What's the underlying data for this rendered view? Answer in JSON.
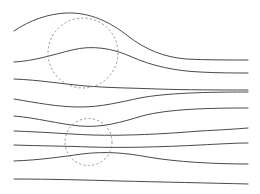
{
  "figure": {
    "kind": "streamline-flow-diagram",
    "title": "",
    "background_color": "#ffffff",
    "width": 260,
    "height": 194
  },
  "style": {
    "streamline_color": "#4a4a4a",
    "streamline_width": 1,
    "circle_color": "#8a8a8a",
    "circle_width": 0.9,
    "circle_dash": "2.2 2.2"
  },
  "chart_data": {
    "type": "line",
    "title": "",
    "xlabel": "",
    "ylabel": "",
    "xlim": [
      0,
      260
    ],
    "ylim": [
      0,
      194
    ],
    "grid": false,
    "legend": null,
    "annotations": [
      {
        "name": "upper-region-circle",
        "shape": "dashed-circle",
        "cx": 83,
        "cy": 53,
        "r": 35
      },
      {
        "name": "lower-region-circle",
        "shape": "dashed-circle",
        "cx": 88.5,
        "cy": 142,
        "r": 23.5
      }
    ],
    "series": [
      {
        "name": "streamline-1",
        "path": "M 14,31 C 30,20 48,14 66,13 C 90,12 110,22 128,36 C 146,50 164,57 186,59 C 206,60 228,60 248,60"
      },
      {
        "name": "streamline-2",
        "path": "M 14,62 C 34,61 52,55 72,50 C 92,45 112,48 132,57 C 152,66 176,71 200,72 C 218,73 234,73 248,73"
      },
      {
        "name": "streamline-3",
        "path": "M 14,79 C 40,80 62,84 86,86 C 110,88 134,88 158,89 C 186,90 220,90 248,90"
      },
      {
        "name": "streamline-4",
        "path": "M 14,99 C 38,103 58,107 80,107 C 102,107 120,102 140,98 C 166,93 206,92 248,92"
      },
      {
        "name": "streamline-5",
        "path": "M 14,116 C 38,118 58,124 80,126 C 102,128 122,122 142,116 C 168,109 208,108 248,108"
      },
      {
        "name": "streamline-6",
        "path": "M 14,131 C 44,132 66,134 92,135 C 124,136 164,134 200,131 C 220,130 236,129 248,128"
      },
      {
        "name": "streamline-7",
        "path": "M 14,145 C 42,146 64,146 90,147 C 122,148 162,147 200,145 C 220,144 236,143 248,143"
      },
      {
        "name": "streamline-8",
        "path": "M 14,161 C 40,160 60,157 82,154 C 106,151 126,153 148,157 C 176,162 216,164 248,164"
      },
      {
        "name": "streamline-9",
        "path": "M 14,179 C 50,179 84,180 120,181 C 160,182 210,183 248,184"
      }
    ]
  }
}
